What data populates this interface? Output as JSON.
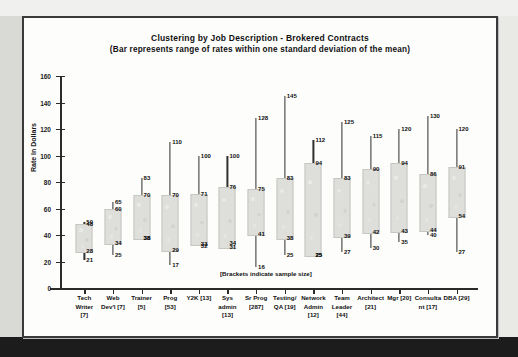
{
  "chart_data": {
    "type": "bar",
    "title": "Clustering by Job Description - Brokered Contracts",
    "subtitle": "(Bar represents range of rates within one standard deviation of the mean)",
    "xlabel": "",
    "ylabel": "Rate In Dollars",
    "ylim": [
      0,
      160
    ],
    "yticks": [
      0,
      20,
      40,
      60,
      80,
      100,
      120,
      140,
      160
    ],
    "grid": false,
    "legend": "none",
    "footnote": "[Brackets indicate sample size]",
    "categories": [
      "Tech Writer [7]",
      "Web Dev'l [7]",
      "Trainer [5]",
      "Prog [53]",
      "Y2K [13]",
      "Sys admin [13]",
      "Sr Prog [287]",
      "Testing/ QA [19]",
      "Network Admin [12]",
      "Team Leader [44]",
      "Architect [21]",
      "Mgr [20]",
      "Consultant [17]",
      "DBA [29]"
    ],
    "category_lines": [
      [
        "Tech",
        "Writer",
        "[7]"
      ],
      [
        "Web",
        "Dev'l [7]"
      ],
      [
        "Trainer",
        "[5]"
      ],
      [
        "Prog",
        "[53]"
      ],
      [
        "Y2K  [13]"
      ],
      [
        "Sys",
        "admin",
        "[13]"
      ],
      [
        "Sr Prog",
        "[287]"
      ],
      [
        "Testing/",
        "QA [19]"
      ],
      [
        "Network",
        "Admin",
        "[12]"
      ],
      [
        "Team",
        "Leader",
        "[44]"
      ],
      [
        "Architect",
        "[21]"
      ],
      [
        "Mgr  [20]"
      ],
      [
        "Consulta",
        "nt [17]"
      ],
      [
        "DBA [29]"
      ]
    ],
    "sample_sizes": [
      7,
      7,
      5,
      53,
      13,
      13,
      287,
      19,
      12,
      44,
      21,
      20,
      17,
      29
    ],
    "series": [
      {
        "name": "max",
        "values": [
          50,
          65,
          83,
          110,
          100,
          100,
          128,
          145,
          112,
          125,
          115,
          120,
          130,
          120
        ]
      },
      {
        "name": "sd_high",
        "values": [
          48,
          60,
          70,
          70,
          71,
          76,
          75,
          83,
          94,
          83,
          90,
          94,
          86,
          91
        ]
      },
      {
        "name": "sd_low",
        "values": [
          28,
          34,
          38,
          29,
          33,
          31,
          41,
          38,
          25,
          39,
          42,
          43,
          44,
          54
        ]
      },
      {
        "name": "min",
        "values": [
          21,
          25,
          38,
          17,
          32,
          34,
          16,
          25,
          25,
          27,
          30,
          35,
          40,
          27
        ]
      }
    ],
    "points": [
      {
        "category": "Tech Writer",
        "max": 50,
        "sd_high": 48,
        "sd_low": 28,
        "min": 21,
        "labels": [
          "50",
          "48",
          "28",
          "21"
        ]
      },
      {
        "category": "Web Dev'l",
        "max": 65,
        "sd_high": 60,
        "sd_low": 34,
        "min": 25,
        "labels": [
          "65",
          "60",
          "34",
          "25"
        ]
      },
      {
        "category": "Trainer",
        "max": 83,
        "sd_high": 70,
        "sd_low": 38,
        "min": 38,
        "labels": [
          "83",
          "70",
          "38",
          "38"
        ]
      },
      {
        "category": "Prog",
        "max": 110,
        "sd_high": 70,
        "sd_low": 29,
        "min": 17,
        "labels": [
          "110",
          "70",
          "29",
          "17"
        ]
      },
      {
        "category": "Y2K",
        "max": 100,
        "sd_high": 71,
        "sd_low": 33,
        "min": 32,
        "labels": [
          "100",
          "71",
          "33",
          "32"
        ]
      },
      {
        "category": "Sys admin",
        "max": 100,
        "sd_high": 76,
        "sd_low": 31,
        "min": 34,
        "labels": [
          "100",
          "76",
          "31",
          "34"
        ]
      },
      {
        "category": "Sr Prog",
        "max": 128,
        "sd_high": 75,
        "sd_low": 41,
        "min": 16,
        "labels": [
          "128",
          "75",
          "41",
          "16"
        ]
      },
      {
        "category": "Testing/ QA",
        "max": 145,
        "sd_high": 83,
        "sd_low": 38,
        "min": 25,
        "labels": [
          "145",
          "83",
          "38",
          "25"
        ]
      },
      {
        "category": "Network Admin",
        "max": 112,
        "sd_high": 94,
        "sd_low": 25,
        "min": 25,
        "labels": [
          "112",
          "94",
          "25",
          "25"
        ]
      },
      {
        "category": "Team Leader",
        "max": 125,
        "sd_high": 83,
        "sd_low": 39,
        "min": 27,
        "labels": [
          "125",
          "83",
          "39",
          "27"
        ]
      },
      {
        "category": "Architect",
        "max": 115,
        "sd_high": 90,
        "sd_low": 42,
        "min": 30,
        "labels": [
          "115",
          "90",
          "42",
          "30"
        ]
      },
      {
        "category": "Mgr",
        "max": 120,
        "sd_high": 94,
        "sd_low": 43,
        "min": 35,
        "labels": [
          "120",
          "94",
          "43",
          "35"
        ]
      },
      {
        "category": "Consultant",
        "max": 130,
        "sd_high": 86,
        "sd_low": 44,
        "min": 40,
        "labels": [
          "130",
          "86",
          "44",
          "40"
        ]
      },
      {
        "category": "DBA",
        "max": 120,
        "sd_high": 91,
        "sd_low": 54,
        "min": 27,
        "labels": [
          "120",
          "91",
          "54",
          "27"
        ]
      }
    ]
  }
}
